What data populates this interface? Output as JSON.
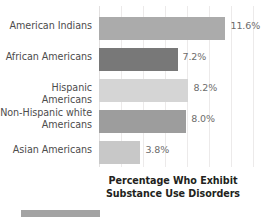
{
  "chart_data": {
    "type": "bar",
    "orientation": "horizontal",
    "title": "",
    "caption": "Percentage Who Exhibit\nSubstance Use Disorders",
    "caption_line1": "Percentage Who Exhibit",
    "caption_line2": "Substance Use Disorders",
    "xlabel": "",
    "ylabel": "",
    "xlim": [
      0,
      15.5
    ],
    "grid": true,
    "gridline_interval": 2,
    "legend": "none",
    "categories": [
      "American Indians",
      "African Americans",
      "Hispanic Americans",
      "Non-Hispanic white Americans",
      "Asian Americans"
    ],
    "values": [
      11.6,
      7.2,
      8.2,
      8.0,
      3.8
    ],
    "value_labels": [
      "11.6%",
      "7.2%",
      "8.2%",
      "8.0%",
      "3.8%"
    ],
    "bar_colors": [
      "#ababab",
      "#787878",
      "#d5d5d5",
      "#9d9d9d",
      "#c8c8c8"
    ],
    "bars": [
      {
        "category": "American Indians",
        "category_line1": "American Indians",
        "category_line2": "",
        "value": 11.6,
        "label": "11.6%",
        "color": "#ababab"
      },
      {
        "category": "African Americans",
        "category_line1": "African Americans",
        "category_line2": "",
        "value": 7.2,
        "label": "7.2%",
        "color": "#787878"
      },
      {
        "category": "Hispanic Americans",
        "category_line1": "Hispanic Americans",
        "category_line2": "",
        "value": 8.2,
        "label": "8.2%",
        "color": "#d5d5d5"
      },
      {
        "category": "Non-Hispanic white Americans",
        "category_line1": "Non-Hispanic",
        "category_line2": "white Americans",
        "value": 8.0,
        "label": "8.0%",
        "color": "#9d9d9d"
      },
      {
        "category": "Asian Americans",
        "category_line1": "Asian Americans",
        "category_line2": "",
        "value": 3.8,
        "label": "3.8%",
        "color": "#c8c8c8"
      }
    ]
  },
  "colors": {
    "gridline": "#eceaea",
    "axis": "#e2e0e0",
    "label_text": "#4d4c4c",
    "value_text": "#6d6c6c",
    "caption_text": "#231f20",
    "background": "#ffffff",
    "bottom_swatch": "#a3a3a3"
  }
}
